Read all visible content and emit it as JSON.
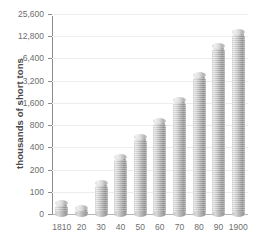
{
  "chart_data": {
    "type": "bar",
    "title": "",
    "xlabel": "",
    "ylabel": "thousands of short tons",
    "categories": [
      "1810",
      "20",
      "30",
      "40",
      "50",
      "60",
      "70",
      "80",
      "90",
      "1900"
    ],
    "values": [
      50,
      25,
      130,
      300,
      550,
      900,
      1750,
      3800,
      9500,
      14500
    ],
    "ytick_labels": [
      "25,600",
      "12,800",
      "6,400",
      "3,200",
      "1,600",
      "800",
      "400",
      "200",
      "100",
      "0"
    ],
    "ytick_values": [
      25600,
      12800,
      6400,
      3200,
      1600,
      800,
      400,
      200,
      100,
      0
    ],
    "yscale": "log2-doubling",
    "ylim": [
      0,
      25600
    ],
    "grid": true,
    "legend": "none",
    "series": [
      {
        "name": "thousands of short tons",
        "values": [
          50,
          25,
          130,
          300,
          550,
          900,
          1750,
          3800,
          9500,
          14500
        ]
      }
    ],
    "colors": {
      "bar_light": "#e8e8e8",
      "bar_mid": "#c0c0c0",
      "bar_dark": "#8f8f8f",
      "axis": "#8b8b8b",
      "gridline": "#ededed",
      "text": "#6e6e6e",
      "title_text": "#4a4a4a",
      "background": "#ffffff"
    }
  }
}
